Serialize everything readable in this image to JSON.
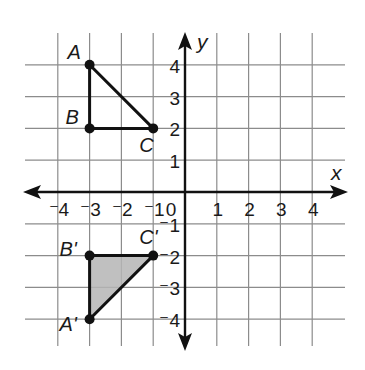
{
  "chart_data": {
    "type": "scatter",
    "title": "",
    "xlabel": "x",
    "ylabel": "y",
    "xlim": [
      -4,
      4
    ],
    "ylim": [
      -4,
      4
    ],
    "grid": true,
    "x_ticks": [
      -4,
      -3,
      -2,
      -1,
      0,
      1,
      2,
      3,
      4
    ],
    "y_ticks": [
      -4,
      -3,
      -2,
      -1,
      1,
      2,
      3,
      4
    ],
    "x_tick_labels": [
      "-4",
      "-3",
      "-2",
      "-1",
      "0",
      "1",
      "2",
      "3",
      "4"
    ],
    "y_tick_labels": [
      "-4",
      "-3",
      "-2",
      "-1",
      "1",
      "2",
      "3",
      "4"
    ],
    "series": [
      {
        "name": "Triangle ABC",
        "shaded": false,
        "points": [
          {
            "label": "A",
            "x": -3,
            "y": 4
          },
          {
            "label": "B",
            "x": -3,
            "y": 2
          },
          {
            "label": "C",
            "x": -1,
            "y": 2
          }
        ]
      },
      {
        "name": "Triangle A'B'C'",
        "shaded": true,
        "fill_color": "#b5b5b5",
        "points": [
          {
            "label": "A'",
            "x": -3,
            "y": -4
          },
          {
            "label": "B'",
            "x": -3,
            "y": -2
          },
          {
            "label": "C'",
            "x": -1,
            "y": -2
          }
        ]
      }
    ]
  },
  "colors": {
    "grid": "#8c8c8c",
    "axis": "#111111",
    "shade": "#b5b5b5"
  }
}
